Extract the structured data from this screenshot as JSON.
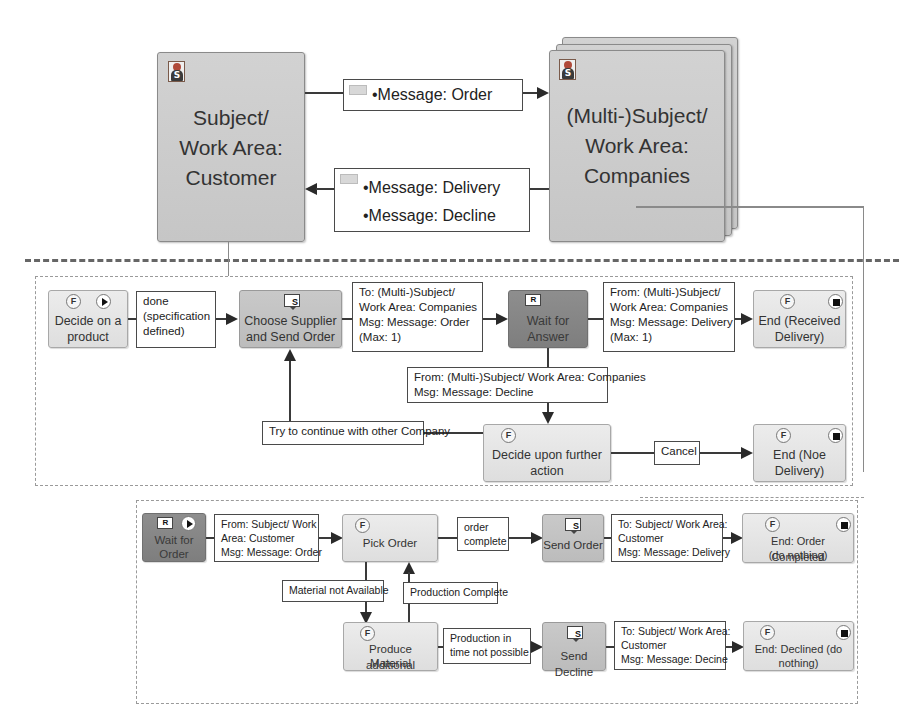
{
  "subjects": {
    "customer": {
      "icon": "subject-icon",
      "icon_letter": "S",
      "lines": [
        "Subject/",
        "Work Area:",
        "Customer"
      ]
    },
    "companies": {
      "icon": "subject-icon",
      "icon_letter": "S",
      "lines": [
        "(Multi-)Subject/",
        "Work Area:",
        "Companies"
      ]
    }
  },
  "messages": {
    "order": {
      "icon": "envelope-icon",
      "items": [
        "•Message: Order"
      ]
    },
    "return": {
      "icon": "envelope-icon",
      "items": [
        "•Message: Delivery",
        "•Message: Decline"
      ]
    }
  },
  "customer_behavior": {
    "states": {
      "decide_product": {
        "label_lines": [
          "Decide on a",
          "product"
        ],
        "icons": [
          "function-icon",
          "start-icon"
        ],
        "icon_text": "F"
      },
      "choose_supplier": {
        "label_lines": [
          "Choose Supplier",
          "and Send Order"
        ],
        "icons": [
          "send-icon"
        ],
        "icon_text": "S"
      },
      "wait_answer": {
        "label_lines": [
          "Wait for",
          "Answer"
        ],
        "icons": [
          "receive-icon"
        ],
        "icon_text": "R"
      },
      "end_received": {
        "label_lines": [
          "End (Received",
          "Delivery)"
        ],
        "icons": [
          "function-icon",
          "end-icon"
        ],
        "icon_text": "F"
      },
      "decide_further": {
        "label_lines": [
          "Decide upon further",
          "action"
        ],
        "icons": [
          "function-icon"
        ],
        "icon_text": "F"
      },
      "end_no_delivery": {
        "label_lines": [
          "End (Noe",
          "Delivery)"
        ],
        "icons": [
          "function-icon",
          "end-icon"
        ],
        "icon_text": "F"
      }
    },
    "transitions": {
      "done": [
        "done",
        "(specification",
        "defined)"
      ],
      "send_order": [
        "To: (Multi-)Subject/",
        "Work Area: Companies",
        "Msg: Message: Order",
        "(Max: 1)"
      ],
      "receive_delivery": [
        "From: (Multi-)Subject/",
        "Work Area: Companies",
        "Msg: Message: Delivery",
        "(Max: 1)"
      ],
      "receive_decline": [
        "From: (Multi-)Subject/ Work Area: Companies",
        "Msg: Message: Decline"
      ],
      "try_other": [
        "Try to continue with other Company"
      ],
      "cancel": [
        "Cancel"
      ]
    }
  },
  "company_behavior": {
    "states": {
      "wait_order": {
        "label_lines": [
          "Wait for",
          "Order"
        ],
        "icons": [
          "receive-icon",
          "start-icon"
        ],
        "icon_text": "R"
      },
      "pick_order": {
        "label_lines": [
          "Pick Order"
        ],
        "icons": [
          "function-icon"
        ],
        "icon_text": "F"
      },
      "send_order": {
        "label_lines": [
          "Send Order"
        ],
        "icons": [
          "send-icon"
        ],
        "icon_text": "S"
      },
      "end_completed": {
        "label_lines": [
          "End: Order Completed",
          "(do nothing)"
        ],
        "icons": [
          "function-icon",
          "end-icon"
        ],
        "icon_text": "F"
      },
      "produce_material": {
        "label_lines": [
          "Produce additional",
          "Material"
        ],
        "icons": [
          "function-icon"
        ],
        "icon_text": "F"
      },
      "send_decline": {
        "label_lines": [
          "Send Decline"
        ],
        "icons": [
          "send-icon"
        ],
        "icon_text": "S"
      },
      "end_declined": {
        "label_lines": [
          "End: Declined (do",
          "nothing)"
        ],
        "icons": [
          "function-icon",
          "end-icon"
        ],
        "icon_text": "F"
      }
    },
    "transitions": {
      "receive_order": [
        "From: Subject/ Work",
        "Area: Customer",
        "Msg: Message: Order"
      ],
      "order_complete": [
        "order",
        "complete"
      ],
      "send_delivery": [
        "To: Subject/ Work Area:",
        "Customer",
        "Msg: Message: Delivery"
      ],
      "material_not_available": [
        "Material not Available"
      ],
      "production_complete": [
        "Production Complete"
      ],
      "production_not_possible": [
        "Production in",
        "time not possible"
      ],
      "send_decline_msg": [
        "To: Subject/ Work Area:",
        "Customer",
        "Msg: Message: Decine"
      ]
    }
  }
}
